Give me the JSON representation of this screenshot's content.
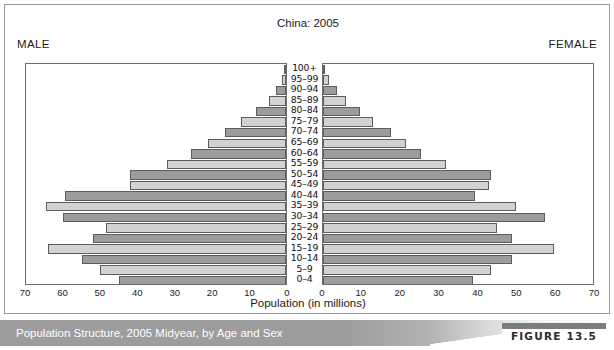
{
  "figure": {
    "caption": "Population Structure, 2005 Midyear, by Age and Sex",
    "number_label": "FIGURE 13.5"
  },
  "labels": {
    "male": "MALE",
    "female": "FEMALE"
  },
  "colors": {
    "bar_dark": "#9c9c9c",
    "bar_light": "#d2d2d2",
    "bar_outline": "#5d5d5d",
    "frame": "#6e6e6e",
    "band": "#9d9d9d"
  },
  "chart_data": {
    "type": "bar",
    "title": "China: 2005",
    "xlabel": "Population (in millions)",
    "ylabel": "",
    "orientation": "horizontal",
    "layout": "population-pyramid",
    "grid": false,
    "legend": "none",
    "xlim_male": [
      70,
      0
    ],
    "xlim_female": [
      0,
      70
    ],
    "ticks_male": [
      70,
      60,
      50,
      40,
      30,
      20,
      10,
      0
    ],
    "ticks_female": [
      0,
      10,
      20,
      30,
      40,
      50,
      60,
      70
    ],
    "categories": [
      "100+",
      "95–99",
      "90–94",
      "85–89",
      "80–84",
      "75–79",
      "70–74",
      "65–69",
      "60–64",
      "55–59",
      "50–54",
      "45–49",
      "40–44",
      "35–39",
      "30–34",
      "25–29",
      "20–24",
      "15–19",
      "10–14",
      "5–9",
      "0–4"
    ],
    "series": [
      {
        "name": "Male",
        "side": "left",
        "values": [
          0.2,
          1.0,
          2.6,
          4.6,
          8.0,
          12.0,
          16.5,
          21.0,
          25.5,
          32.0,
          42.0,
          42.0,
          59.5,
          64.5,
          60.0,
          48.5,
          52.0,
          64.0,
          55.0,
          50.0,
          45.0
        ]
      },
      {
        "name": "Female",
        "side": "right",
        "values": [
          0.3,
          1.5,
          3.5,
          6.0,
          9.5,
          13.0,
          17.5,
          21.5,
          25.5,
          32.0,
          43.5,
          43.0,
          39.5,
          50.0,
          57.5,
          45.0,
          49.0,
          60.0,
          49.0,
          43.5,
          39.0
        ]
      }
    ]
  }
}
